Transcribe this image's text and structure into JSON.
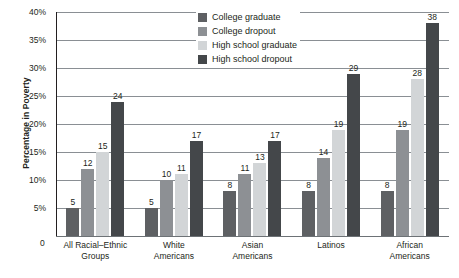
{
  "chart_data": {
    "type": "bar",
    "title": "",
    "xlabel": "",
    "ylabel": "Percentage in Poverty",
    "ylim": [
      0,
      40
    ],
    "ytick_labels": [
      "40%",
      "35%",
      "30%",
      "25%",
      "20%",
      "15%",
      "10%",
      "5%"
    ],
    "ytick_values": [
      40,
      35,
      30,
      25,
      20,
      15,
      10,
      5
    ],
    "origin_label": "0",
    "grid": true,
    "legend_position": "top-right-inside",
    "categories": [
      "All Racial–Ethnic Groups",
      "White Americans",
      "Asian Americans",
      "Latinos",
      "African Americans"
    ],
    "category_lines": [
      [
        "All Racial–Ethnic",
        "Groups"
      ],
      [
        "White",
        "Americans"
      ],
      [
        "Asian",
        "Americans"
      ],
      [
        "Latinos",
        ""
      ],
      [
        "African",
        "Americans"
      ]
    ],
    "series": [
      {
        "name": "College graduate",
        "color": "#5e6063",
        "values": [
          5,
          5,
          8,
          8,
          8
        ]
      },
      {
        "name": "College dropout",
        "color": "#8d9094",
        "values": [
          12,
          10,
          11,
          14,
          19
        ]
      },
      {
        "name": "High school graduate",
        "color": "#d2d5d7",
        "values": [
          15,
          11,
          13,
          19,
          28
        ]
      },
      {
        "name": "High school dropout",
        "color": "#44474a",
        "values": [
          24,
          17,
          17,
          29,
          38
        ]
      }
    ]
  }
}
